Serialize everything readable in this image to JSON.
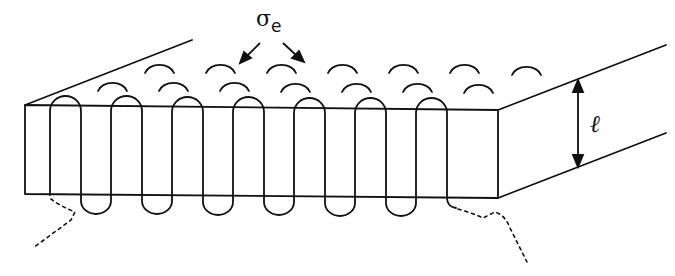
{
  "figure": {
    "labels": {
      "fold_surface_energy": "σ",
      "fold_surface_energy_subscript": "e",
      "thickness": "ℓ"
    },
    "colors": {
      "line": "#111111",
      "background": "#ffffff"
    },
    "front_face": {
      "x_left": 25,
      "x_right": 498,
      "y_top_left": 105,
      "y_top_right": 110,
      "y_bottom_left": 194,
      "y_bottom_right": 198
    },
    "chain_stems_x": [
      50,
      81,
      111,
      142,
      172,
      203,
      233,
      264,
      294,
      325,
      355,
      386,
      416,
      447
    ],
    "top_fold_count": 7,
    "bottom_fold_count": 6,
    "surface_fold_rows": 2
  }
}
